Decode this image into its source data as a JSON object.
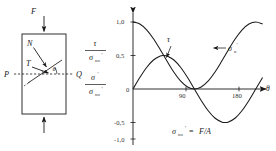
{
  "figure": {
    "name": "stress-on-inclined-plane-figure",
    "background": "#ffffff",
    "ink": "#1a1a1a"
  },
  "free_body_diagram": {
    "name": "free-body-diagram",
    "force_top_label": "F",
    "force_bottom_label": "",
    "point_left_label": "P",
    "point_right_label": "Q",
    "normal_label": "N",
    "shear_label": "T",
    "angle_label": "θ",
    "bar_description": "rectangular bar in uniaxial tension with inclined section plane"
  },
  "chart_data": {
    "type": "line",
    "title": "",
    "xlabel": "θ",
    "ylabel": "",
    "ylabel_tau": {
      "numerator": "τ",
      "denominator_sym": "σ",
      "denominator_sub": "no",
      "denominator_sup": "′"
    },
    "ylabel_sigma": {
      "numerator_sym": "σ",
      "numerator_sup": "′",
      "denominator_sym": "σ",
      "denominator_sub": "no",
      "denominator_sup": "′"
    },
    "annotation": {
      "lhs_sym": "σ",
      "lhs_sub": "no",
      "lhs_sup": "′",
      "eq": "=",
      "rhs": "F/A"
    },
    "xlim": [
      0,
      195
    ],
    "ylim": [
      -1.15,
      1.15
    ],
    "xticks": [
      90,
      180
    ],
    "xtick_labels": [
      "90",
      "180"
    ],
    "yticks": [
      1.0,
      0.5,
      0,
      -0.5,
      -1.0
    ],
    "ytick_labels": [
      "1,0",
      "0,5",
      "0",
      "-0,5",
      "-1,0"
    ],
    "grid": false,
    "legend_position": "inline-annotations",
    "series": [
      {
        "name": "σ_n′",
        "label_sym": "σ",
        "label_sub": "n",
        "label_sup": "′",
        "formula": "cos^2(theta)",
        "color": "#1a1a1a",
        "x": [
          0,
          10,
          20,
          30,
          40,
          45,
          50,
          60,
          70,
          80,
          90,
          100,
          110,
          120,
          130,
          135,
          140,
          150,
          160,
          170,
          180,
          190
        ],
        "y": [
          1.0,
          0.97,
          0.883,
          0.75,
          0.587,
          0.5,
          0.413,
          0.25,
          0.117,
          0.03,
          0.0,
          0.03,
          0.117,
          0.25,
          0.413,
          0.5,
          0.587,
          0.75,
          0.883,
          0.97,
          1.0,
          0.97
        ]
      },
      {
        "name": "τ",
        "label_sym": "τ",
        "formula": "sin(theta)cos(theta)",
        "color": "#1a1a1a",
        "x": [
          0,
          10,
          20,
          30,
          40,
          45,
          50,
          60,
          70,
          80,
          90,
          100,
          110,
          120,
          130,
          135,
          140,
          150,
          160,
          170,
          180,
          190
        ],
        "y": [
          0.0,
          0.171,
          0.321,
          0.433,
          0.492,
          0.5,
          0.492,
          0.433,
          0.321,
          0.171,
          0.0,
          -0.171,
          -0.321,
          -0.433,
          -0.492,
          -0.5,
          -0.492,
          -0.433,
          -0.321,
          -0.171,
          0.0,
          0.171
        ]
      }
    ]
  }
}
